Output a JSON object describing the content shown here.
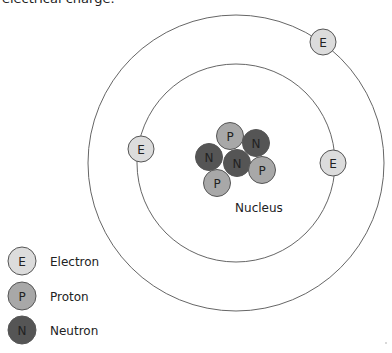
{
  "caption": "electrical charge.",
  "colors": {
    "electron": "#dcdcdc",
    "proton": "#a8a8a8",
    "neutron": "#555555",
    "stroke": "#555555",
    "orbit": "#666666"
  },
  "diagram": {
    "orbits": [
      "inner-shell",
      "outer-shell"
    ],
    "electrons": [
      {
        "shell": "outer",
        "label": "E"
      },
      {
        "shell": "inner",
        "label": "E"
      },
      {
        "shell": "inner",
        "label": "E"
      }
    ],
    "nucleus": {
      "label": "Nucleus",
      "particles": [
        {
          "type": "proton",
          "label": "P"
        },
        {
          "type": "neutron",
          "label": "N"
        },
        {
          "type": "neutron",
          "label": "N"
        },
        {
          "type": "neutron",
          "label": "N"
        },
        {
          "type": "proton",
          "label": "P"
        },
        {
          "type": "proton",
          "label": "P"
        }
      ]
    }
  },
  "legend": [
    {
      "type": "electron",
      "symbol": "E",
      "label": "Electron"
    },
    {
      "type": "proton",
      "symbol": "P",
      "label": "Proton"
    },
    {
      "type": "neutron",
      "symbol": "N",
      "label": "Neutron"
    }
  ]
}
